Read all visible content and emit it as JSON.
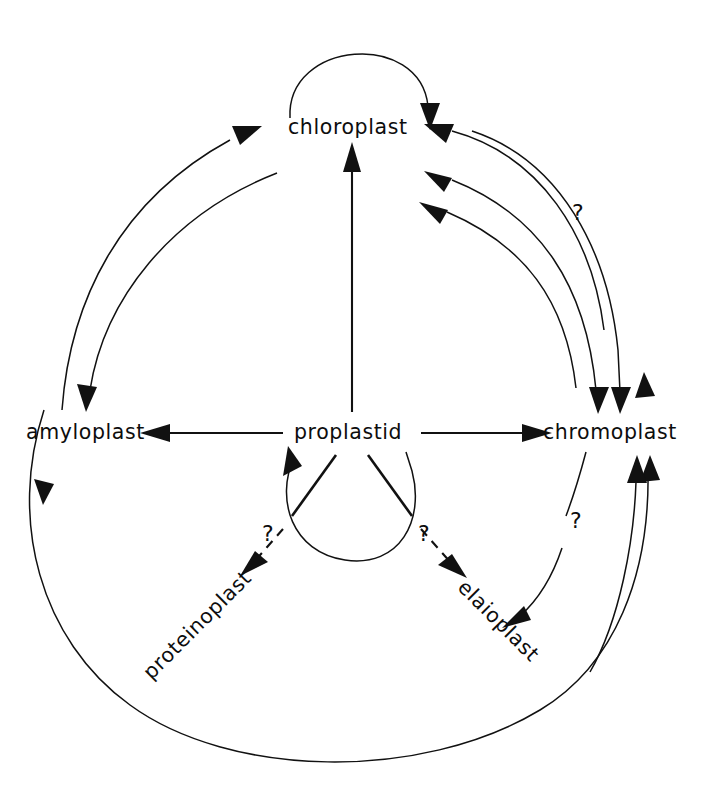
{
  "diagram": {
    "type": "node-link-diagram",
    "background_color": "#ffffff",
    "ink_color": "#111111",
    "nodes": [
      {
        "id": "chloroplast",
        "label": "chloroplast",
        "x": 352,
        "y": 128,
        "rotation": 0
      },
      {
        "id": "amyloplast",
        "label": "amyloplast",
        "x": 78,
        "y": 433,
        "rotation": 0
      },
      {
        "id": "proplastid",
        "label": "proplastid",
        "x": 352,
        "y": 433,
        "rotation": 0
      },
      {
        "id": "chromoplast",
        "label": "chromoplast",
        "x": 616,
        "y": 433,
        "rotation": 0
      },
      {
        "id": "proteinoplast",
        "label": "proteinoplast",
        "x": 213,
        "y": 605,
        "rotation": -45
      },
      {
        "id": "elaioplast",
        "label": "elaioplast",
        "x": 506,
        "y": 613,
        "rotation": 45
      }
    ],
    "edges": [
      {
        "from": "chloroplast",
        "to": "chloroplast",
        "style": "solid",
        "shape": "self-loop-arc-above",
        "label": ""
      },
      {
        "from": "proplastid",
        "to": "chloroplast",
        "style": "solid",
        "shape": "straight-vertical",
        "label": ""
      },
      {
        "from": "proplastid",
        "to": "amyloplast",
        "style": "solid",
        "shape": "straight-horizontal",
        "label": ""
      },
      {
        "from": "proplastid",
        "to": "chromoplast",
        "style": "solid",
        "shape": "straight-horizontal",
        "label": ""
      },
      {
        "from": "proplastid",
        "to": "proplastid",
        "style": "solid",
        "shape": "self-loop-circle-below",
        "label": ""
      },
      {
        "from": "amyloplast",
        "to": "chloroplast",
        "style": "solid",
        "shape": "arc-outer-left",
        "label": ""
      },
      {
        "from": "chloroplast",
        "to": "amyloplast",
        "style": "solid",
        "shape": "arc-inner-left",
        "label": ""
      },
      {
        "from": "chloroplast",
        "to": "chromoplast",
        "style": "solid",
        "shape": "arc-outer-right",
        "label": "?"
      },
      {
        "from": "chromoplast",
        "to": "chloroplast",
        "style": "solid",
        "shape": "arc-middle-right",
        "label": ""
      },
      {
        "from": "chromoplast",
        "to": "chloroplast",
        "style": "solid",
        "shape": "arc-inner-right",
        "label": ""
      },
      {
        "from": "chromoplast",
        "to": "elaioplast",
        "style": "solid",
        "shape": "arc-short",
        "label": "?"
      },
      {
        "from": "elaioplast",
        "to": "chromoplast",
        "style": "solid",
        "shape": "arc-outer-bottom-right",
        "label": ""
      },
      {
        "from": "amyloplast",
        "to": "chromoplast",
        "style": "solid",
        "shape": "outer-circle-bottom",
        "label": ""
      },
      {
        "from": "proplastid",
        "to": "proteinoplast",
        "style": "dashed",
        "shape": "diagonal",
        "label": "?"
      },
      {
        "from": "proplastid",
        "to": "elaioplast",
        "style": "dashed",
        "shape": "diagonal",
        "label": "?"
      }
    ],
    "annotations": [
      {
        "id": "q-upper-right",
        "text": "?",
        "x": 578,
        "y": 216
      },
      {
        "id": "q-lower-right",
        "text": "?",
        "x": 576,
        "y": 523
      },
      {
        "id": "q-left-dashed",
        "text": "?",
        "x": 268,
        "y": 538
      },
      {
        "id": "q-right-dashed",
        "text": "?",
        "x": 424,
        "y": 538
      }
    ]
  }
}
